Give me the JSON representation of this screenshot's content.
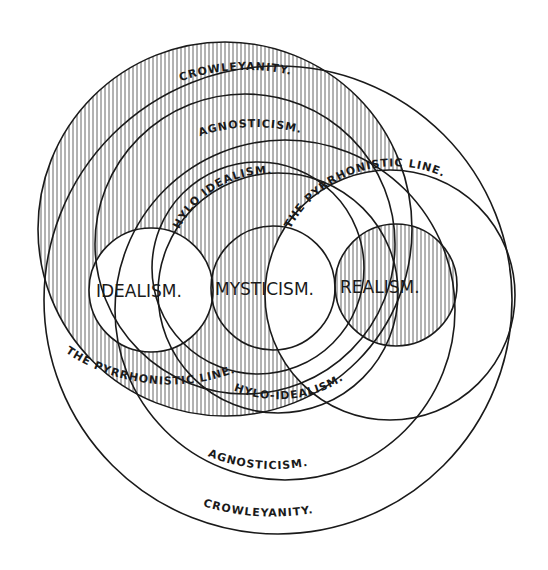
{
  "diagram": {
    "labels": {
      "crowleyanity_top": "CROWLEYANITY.",
      "agnosticism_top": "AGNOSTICISM.",
      "hylo_idealism_top": "HYLO IDEALISM.",
      "pyrrhonistic_line_top": "THE PYRRHONISTIC LINE.",
      "idealism": "IDEALISM.",
      "mysticism": "MYSTICISM.",
      "realism": "REALISM.",
      "pyrrhonistic_line_bottom": "THE PYRRHONISTIC LINE.",
      "hylo_idealism_bottom": "HYLO-IDEALISM.",
      "agnosticism_bottom": "AGNOSTICISM.",
      "crowleyanity_bottom": "CROWLEYANITY."
    },
    "colors": {
      "ink": "#1a1a1a",
      "paper": "#ffffff",
      "hatch": "#555555"
    }
  }
}
